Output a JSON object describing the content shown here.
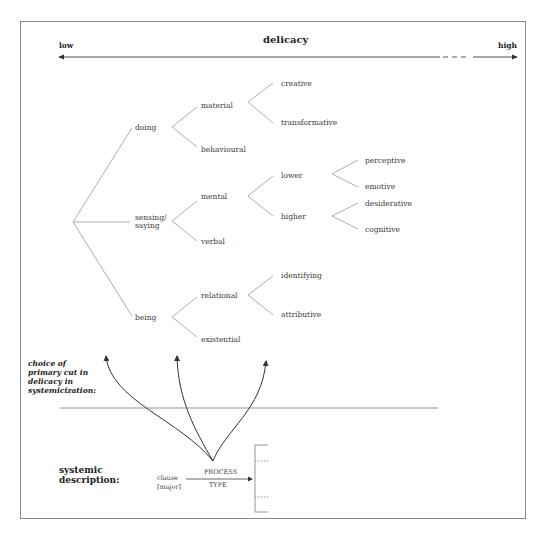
{
  "header": {
    "title": "delicacy",
    "low_label": "low",
    "high_label": "high"
  },
  "tree": {
    "root_children": [
      {
        "label": "doing",
        "children": [
          {
            "label": "material",
            "children": [
              {
                "label": "creative"
              },
              {
                "label": "transformative"
              }
            ]
          },
          {
            "label": "behavioural"
          }
        ]
      },
      {
        "label": "sensing/\nsaying",
        "line1": "sensing/",
        "line2": "saying",
        "children": [
          {
            "label": "mental",
            "children": [
              {
                "label": "lower",
                "children": [
                  {
                    "label": "perceptive"
                  },
                  {
                    "label": "emotive"
                  }
                ]
              },
              {
                "label": "higher",
                "children": [
                  {
                    "label": "desiderative"
                  },
                  {
                    "label": "cognitive"
                  }
                ]
              }
            ]
          },
          {
            "label": "verbal"
          }
        ]
      },
      {
        "label": "being",
        "children": [
          {
            "label": "relational",
            "children": [
              {
                "label": "identifying"
              },
              {
                "label": "attributive"
              }
            ]
          },
          {
            "label": "existential"
          }
        ]
      }
    ]
  },
  "labels": {
    "doing": "doing",
    "sensing_1": "sensing/",
    "sensing_2": "saying",
    "being": "being",
    "material": "material",
    "behavioural": "behavioural",
    "mental": "mental",
    "verbal": "verbal",
    "relational": "relational",
    "existential": "existential",
    "creative": "creative",
    "transformative": "transformative",
    "lower": "lower",
    "higher": "higher",
    "identifying": "identifying",
    "attributive": "attributive",
    "perceptive": "perceptive",
    "emotive": "emotive",
    "desiderative": "desiderative",
    "cognitive": "cognitive"
  },
  "annotation": {
    "line1": "choice of",
    "line2": "primary cut in",
    "line3": "delicacy in",
    "line4": "systemicization:"
  },
  "systemic": {
    "heading_1": "systemic",
    "heading_2": "description:",
    "entry_1": "clause",
    "entry_2": "[major]",
    "system_1": "PROCESS",
    "system_2": "TYPE"
  },
  "colors": {
    "line": "#8a8a8a",
    "text": "#333333",
    "frame": "#8a8a8a"
  }
}
